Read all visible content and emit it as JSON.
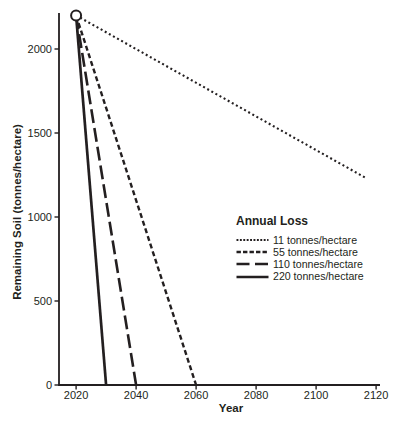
{
  "figure": {
    "background": "#ffffff",
    "ink": "#231f20"
  },
  "chart_data": {
    "type": "line",
    "xlabel": "Year",
    "ylabel": "Remaining Soil (tonnes/hectare)",
    "xlim": [
      2014.3,
      2121.3
    ],
    "ylim": [
      0,
      2214
    ],
    "x_ticks": [
      2020,
      2040,
      2060,
      2080,
      2100,
      2120
    ],
    "y_ticks": [
      0,
      500,
      1000,
      1500,
      2000
    ],
    "grid": false,
    "start_point": {
      "year": 2020,
      "soil_tonnes_per_hectare": 2200,
      "marker": "open-circle"
    },
    "legend": {
      "title": "Annual Loss",
      "position": "center-right"
    },
    "series": [
      {
        "name": "11 tonnes/hectare",
        "annual_loss_tonnes_per_hectare": 11,
        "line_style": "dotted",
        "points": [
          [
            2020,
            2200
          ],
          [
            2117,
            1228
          ]
        ]
      },
      {
        "name": "55 tonnes/hectare",
        "annual_loss_tonnes_per_hectare": 55,
        "line_style": "short-dash",
        "points": [
          [
            2020,
            2200
          ],
          [
            2060,
            0
          ]
        ]
      },
      {
        "name": "110 tonnes/hectare",
        "annual_loss_tonnes_per_hectare": 110,
        "line_style": "long-dash",
        "points": [
          [
            2020,
            2200
          ],
          [
            2040,
            0
          ]
        ]
      },
      {
        "name": "220 tonnes/hectare",
        "annual_loss_tonnes_per_hectare": 220,
        "line_style": "solid",
        "points": [
          [
            2020,
            2200
          ],
          [
            2030,
            0
          ]
        ]
      }
    ]
  }
}
